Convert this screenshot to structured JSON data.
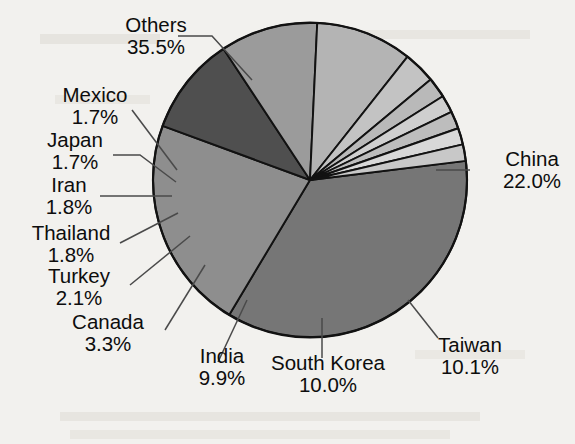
{
  "chart_data": {
    "type": "pie",
    "title": "",
    "subtitle": "",
    "xlabel": "",
    "ylabel": "",
    "legend_position": "none",
    "grid": false,
    "units": "percent",
    "labels": [
      "Others",
      "China",
      "Taiwan",
      "South Korea",
      "India",
      "Canada",
      "Turkey",
      "Thailand",
      "Iran",
      "Japan",
      "Mexico"
    ],
    "values": [
      35.5,
      22.0,
      10.1,
      10.0,
      9.9,
      3.3,
      2.1,
      1.8,
      1.8,
      1.7,
      1.7
    ],
    "value_labels": [
      "35.5%",
      "22.0%",
      "10.1%",
      "10.0%",
      "9.9%",
      "3.3%",
      "2.1%",
      "1.8%",
      "1.8%",
      "1.7%",
      "1.7%"
    ],
    "colors": [
      "#767676",
      "#8e8e8e",
      "#4f4f4f",
      "#9b9b9b",
      "#b4b4b4",
      "#c3c3c3",
      "#b9b9b9",
      "#cfcfcf",
      "#bdbdbd",
      "#d8d8d8",
      "#c8c8c8"
    ],
    "start_angle_deg": -7,
    "direction": "clockwise",
    "slices": [
      {
        "label": "Others",
        "value": 35.5,
        "value_label": "35.5%",
        "color": "#767676"
      },
      {
        "label": "China",
        "value": 22.0,
        "value_label": "22.0%",
        "color": "#8e8e8e"
      },
      {
        "label": "Taiwan",
        "value": 10.1,
        "value_label": "10.1%",
        "color": "#4f4f4f"
      },
      {
        "label": "South Korea",
        "value": 10.0,
        "value_label": "10.0%",
        "color": "#9b9b9b"
      },
      {
        "label": "India",
        "value": 9.9,
        "value_label": "9.9%",
        "color": "#b4b4b4"
      },
      {
        "label": "Canada",
        "value": 3.3,
        "value_label": "3.3%",
        "color": "#c3c3c3"
      },
      {
        "label": "Turkey",
        "value": 2.1,
        "value_label": "2.1%",
        "color": "#b9b9b9"
      },
      {
        "label": "Thailand",
        "value": 1.8,
        "value_label": "1.8%",
        "color": "#cfcfcf"
      },
      {
        "label": "Iran",
        "value": 1.8,
        "value_label": "1.8%",
        "color": "#bdbdbd"
      },
      {
        "label": "Japan",
        "value": 1.7,
        "value_label": "1.7%",
        "color": "#d8d8d8"
      },
      {
        "label": "Mexico",
        "value": 1.7,
        "value_label": "1.7%",
        "color": "#c8c8c8"
      }
    ],
    "total": 99.9
  },
  "labels": {
    "others": {
      "name": "Others",
      "pct": "35.5%"
    },
    "mexico": {
      "name": "Mexico",
      "pct": "1.7%"
    },
    "japan": {
      "name": "Japan",
      "pct": "1.7%"
    },
    "iran": {
      "name": "Iran",
      "pct": "1.8%"
    },
    "thailand": {
      "name": "Thailand",
      "pct": "1.8%"
    },
    "turkey": {
      "name": "Turkey",
      "pct": "2.1%"
    },
    "canada": {
      "name": "Canada",
      "pct": "3.3%"
    },
    "india": {
      "name": "India",
      "pct": "9.9%"
    },
    "south_korea": {
      "name": "South Korea",
      "pct": "10.0%"
    },
    "taiwan": {
      "name": "Taiwan",
      "pct": "10.1%"
    },
    "china": {
      "name": "China",
      "pct": "22.0%"
    }
  },
  "style": {
    "background": "#f2f1ee",
    "outline": "#121212",
    "text": "#0d0d0d"
  }
}
